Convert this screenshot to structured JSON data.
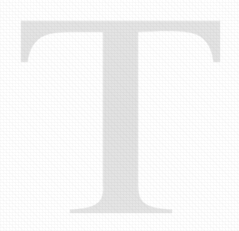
{
  "canvas": {
    "width": 239,
    "height": 231,
    "background_color": "#ffffff"
  },
  "glyph": {
    "character": "T",
    "name": "drop-cap-letter-t",
    "style": "serif-capital",
    "fill_color": "#e2e2e2",
    "edge_color": "#ececec",
    "texture": "faint-halftone-dither",
    "description": "Large very light gray serif capital letter T",
    "metrics": {
      "crossbar_left_x": 21,
      "crossbar_right_x": 220,
      "crossbar_top_y": 21,
      "crossbar_bottom_y": 32,
      "serif_drop_y": 62,
      "stem_left_x": 103,
      "stem_right_x": 138,
      "stem_flare_start_y": 185,
      "foot_left_x": 70,
      "foot_right_x": 172,
      "baseline_y": 213
    }
  }
}
